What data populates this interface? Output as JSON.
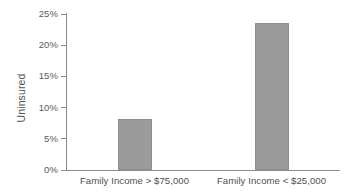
{
  "chart_data": {
    "type": "bar",
    "title": "",
    "subtitle": "",
    "xlabel": "",
    "ylabel": "Uninsured",
    "categories": [
      "Family Income > $75,000",
      "Family Income < $25,000"
    ],
    "values": [
      8.2,
      23.5
    ],
    "value_unit": "%",
    "ylim": [
      0,
      25
    ],
    "ytick_labels": [
      "0%",
      "5%",
      "10%",
      "15%",
      "20%",
      "25%"
    ],
    "ytick_values": [
      0,
      5,
      10,
      15,
      20,
      25
    ],
    "grid": false,
    "legend": null,
    "legend_position": "none",
    "series": [
      {
        "name": "Uninsured",
        "values": [
          8.2,
          23.5
        ],
        "color": "#9b9b9b"
      }
    ],
    "colors": {
      "bar_fill": "#9b9b9b",
      "bar_stroke": "#8f8f8f",
      "axis": "#8c8c8c",
      "tick_text": "#5a5a5a",
      "label_text": "#4f4f4f",
      "background": "#ffffff"
    }
  }
}
